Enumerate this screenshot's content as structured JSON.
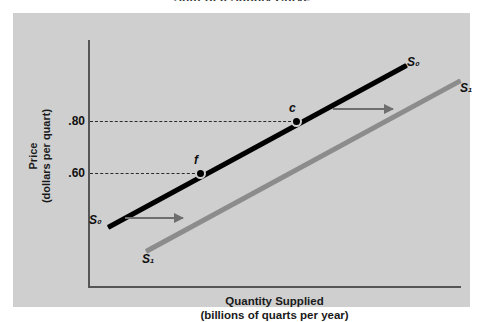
{
  "figure": {
    "title": "Shift of a Supply Curve"
  },
  "chart_data": {
    "type": "line",
    "title": "Shift of a Supply Curve",
    "xlabel": "Quantity Supplied\n(billions of quarts per year)",
    "ylabel": "Price\n(dollars per quart)",
    "grid": false,
    "legend_position": "inline-curve-labels",
    "ytick_labels": [
      ".80",
      ".60"
    ],
    "xtick_labels": [],
    "series": [
      {
        "name": "S0",
        "label": "S₀",
        "color": "#000000",
        "description": "Original upward-sloping supply curve",
        "points": [
          {
            "x": 0.1,
            "y": 0.42
          },
          {
            "x": 0.92,
            "y": 0.98
          }
        ]
      },
      {
        "name": "S1",
        "label": "S₁",
        "color": "#8c8c8c",
        "description": "New supply curve shifted to the right",
        "points": [
          {
            "x": 0.22,
            "y": 0.34
          },
          {
            "x": 1.0,
            "y": 0.9
          }
        ]
      }
    ],
    "markers": [
      {
        "name": "c",
        "label": "c",
        "price": ".80",
        "on_curve": "S0"
      },
      {
        "name": "f",
        "label": "f",
        "price": ".60",
        "on_curve": "S0"
      }
    ],
    "guides": [
      {
        "name": "price-80-guide",
        "value": ".80",
        "style": "dashed"
      },
      {
        "name": "price-60-guide",
        "value": ".60",
        "style": "dashed"
      }
    ],
    "annotations": [
      {
        "name": "upper-shift-arrow",
        "direction": "right",
        "meaning": "supply shifts right"
      },
      {
        "name": "lower-shift-arrow",
        "direction": "right",
        "meaning": "supply shifts right"
      }
    ]
  },
  "axes": {
    "y_label": "Price\n(dollars per quart)",
    "x_label": "Quantity Supplied\n(billions of quarts per year)",
    "y_ticks": {
      "high": ".80",
      "low": ".60"
    }
  },
  "curves": {
    "s0_top": "S₀",
    "s0_bottom": "S₀",
    "s1_top": "S₁",
    "s1_bottom": "S₁"
  },
  "points": {
    "c": "c",
    "f": "f"
  },
  "colors": {
    "panel_background": "#cfcfcf",
    "page_background": "#ffffff",
    "axis": "#555555",
    "curve_s0": "#000000",
    "curve_s1": "#8c8c8c",
    "arrow": "#6e6e6e",
    "text": "#111111"
  }
}
